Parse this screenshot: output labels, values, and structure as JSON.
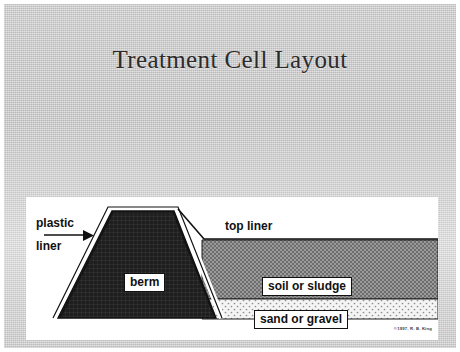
{
  "slide": {
    "title": "Treatment Cell Layout",
    "background_color": "#cccccc",
    "panel_color": "#ffffff"
  },
  "diagram": {
    "name": "treatment-cell-cross-section",
    "copyright": "©1997, R. B. King",
    "labels": {
      "plastic": "plastic",
      "liner": "liner",
      "top_liner": "top liner",
      "berm": "berm",
      "soil_or_sludge": "soil or sludge",
      "sand_or_gravel": "sand or gravel"
    },
    "layers": [
      {
        "name": "berm",
        "label": "berm",
        "fill": "crosshatch-dark",
        "color": "#3b3b3b"
      },
      {
        "name": "plastic-liner",
        "label": "plastic liner",
        "fill": "solid-white",
        "color": "#ffffff"
      },
      {
        "name": "top-liner",
        "label": "top liner",
        "fill": "line",
        "color": "#000000"
      },
      {
        "name": "soil-or-sludge",
        "label": "soil or sludge",
        "fill": "checker-gray",
        "color": "#8a8a8a"
      },
      {
        "name": "sand-or-gravel",
        "label": "sand or gravel",
        "fill": "dotted-light",
        "color": "#e8e8e8"
      }
    ]
  }
}
